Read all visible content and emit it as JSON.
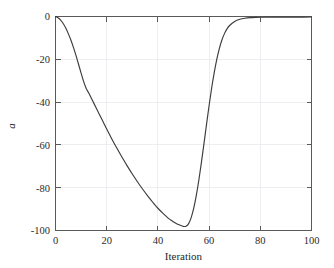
{
  "chart_data": {
    "type": "line",
    "title": "",
    "subtitle": "",
    "xlabel": "Iteration",
    "ylabel": "a",
    "xlim": [
      0,
      100
    ],
    "ylim": [
      -100,
      0
    ],
    "grid": true,
    "legend": null,
    "legend_position": "none",
    "xticks": [
      0,
      20,
      40,
      60,
      80,
      100
    ],
    "xtick_labels": [
      "0",
      "20",
      "40",
      "60",
      "80",
      "100"
    ],
    "yticks": [
      0,
      -20,
      -40,
      -60,
      -80,
      -100
    ],
    "ytick_labels": [
      "0",
      "-20",
      "-40",
      "-60",
      "-80",
      "-100"
    ],
    "series": [
      {
        "name": "a",
        "color": "#3c3c3c",
        "x": [
          0,
          1,
          2,
          3,
          4,
          5,
          6,
          7,
          8,
          9,
          10,
          11,
          12,
          13,
          14,
          15,
          16,
          17,
          18,
          19,
          20,
          22,
          24,
          26,
          28,
          30,
          32,
          34,
          36,
          38,
          40,
          42,
          44,
          45,
          46,
          47,
          48,
          49,
          50,
          51,
          52,
          53,
          54,
          55,
          56,
          57,
          58,
          59,
          60,
          61,
          62,
          63,
          64,
          65,
          66,
          67,
          68,
          70,
          72,
          74,
          76,
          78,
          80,
          85,
          90,
          95,
          100
        ],
        "y": [
          0,
          -0.6,
          -1.7,
          -3.3,
          -5.4,
          -8.0,
          -11.0,
          -14.4,
          -18.2,
          -22.3,
          -26.5,
          -30.4,
          -33.6,
          -35.8,
          -38.2,
          -40.6,
          -43.0,
          -45.4,
          -47.8,
          -50.2,
          -52.6,
          -57.2,
          -61.6,
          -65.8,
          -69.8,
          -73.6,
          -77.2,
          -80.6,
          -83.8,
          -86.8,
          -89.6,
          -92.0,
          -94.2,
          -95.1,
          -95.9,
          -96.6,
          -97.2,
          -97.7,
          -98.1,
          -98.0,
          -96.8,
          -94.0,
          -89.6,
          -83.6,
          -76.4,
          -68.2,
          -59.4,
          -50.4,
          -41.6,
          -33.4,
          -26.2,
          -20.0,
          -15.0,
          -11.0,
          -8.0,
          -5.8,
          -4.2,
          -2.3,
          -1.3,
          -0.8,
          -0.55,
          -0.42,
          -0.35,
          -0.3,
          -0.28,
          -0.26,
          -0.25
        ]
      }
    ]
  },
  "axes": {
    "x_axis_label": "Iteration",
    "y_axis_label": "a"
  }
}
